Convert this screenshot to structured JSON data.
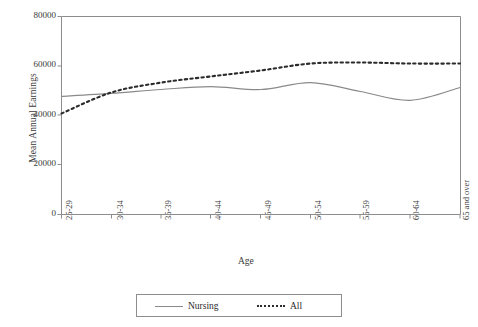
{
  "chart_data": {
    "type": "line",
    "title": "",
    "xlabel": "Age",
    "ylabel": "Mean Annual Earnings",
    "categories": [
      "25-29",
      "30-34",
      "35-39",
      "40-44",
      "45-49",
      "50-54",
      "55-59",
      "60-64",
      "65 and over"
    ],
    "ylim": [
      0,
      80000
    ],
    "yticks": [
      0,
      20000,
      40000,
      60000,
      80000
    ],
    "ytick_labels": [
      "0",
      "20000",
      "40000",
      "60000",
      "80000"
    ],
    "grid": false,
    "legend_position": "bottom",
    "series": [
      {
        "name": "Nursing",
        "style": "solid",
        "color": "#8a8a8a",
        "values": [
          47700,
          48900,
          50500,
          51700,
          50500,
          53300,
          49700,
          46100,
          51300
        ]
      },
      {
        "name": "All",
        "style": "dotted",
        "color": "#2b2b2b",
        "values": [
          40800,
          49300,
          53300,
          55800,
          58200,
          61000,
          61400,
          61000,
          61000
        ]
      }
    ]
  },
  "axes": {
    "ylabel": "Mean Annual Earnings",
    "xlabel": "Age"
  },
  "legend": {
    "items": [
      {
        "label": "Nursing",
        "style": "solid"
      },
      {
        "label": "All",
        "style": "dotted"
      }
    ]
  }
}
